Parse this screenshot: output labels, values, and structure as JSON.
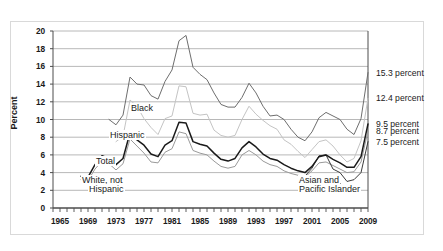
{
  "figure": {
    "ylabel": "Percent"
  },
  "chart_data": {
    "type": "line",
    "title": "",
    "subtitle": "",
    "xlabel": "",
    "ylabel": "Percent",
    "xlim": [
      1964,
      2009
    ],
    "ylim": [
      0,
      20
    ],
    "ytick_step": 2,
    "grid": "horizontal",
    "legend": "inline-annotations",
    "xticks": [
      1965,
      1969,
      1973,
      1977,
      1981,
      1985,
      1989,
      1993,
      1997,
      2001,
      2005,
      2009
    ],
    "xtick_minor_step": 1,
    "yticks": [
      0,
      2,
      4,
      6,
      8,
      10,
      12,
      14,
      16,
      18,
      20
    ],
    "colors": {
      "total": "#1a1a1a",
      "black": "#6e6e6e",
      "hispanic": "#c4c4c4",
      "white_not_hispanic": "#9a9a9a",
      "asian_pacific_islander": "#3c3c3c",
      "gridline": "#a6a6a6",
      "axis": "#4d4d4d",
      "frame": "#d9d9d9"
    },
    "series": [
      {
        "name": "Black",
        "label": "Black",
        "color": "#6e6e6e",
        "x": [
          1972,
          1973,
          1974,
          1975,
          1976,
          1977,
          1978,
          1979,
          1980,
          1981,
          1982,
          1983,
          1984,
          1985,
          1986,
          1987,
          1988,
          1989,
          1990,
          1991,
          1992,
          1993,
          1994,
          1995,
          1996,
          1997,
          1998,
          1999,
          2000,
          2001,
          2002,
          2003,
          2004,
          2005,
          2006,
          2007,
          2008,
          2009
        ],
        "values": [
          10.0,
          9.4,
          10.5,
          14.8,
          14.0,
          13.9,
          12.7,
          12.3,
          14.3,
          15.6,
          18.9,
          19.5,
          15.9,
          15.1,
          14.5,
          13.0,
          11.7,
          11.4,
          11.4,
          12.5,
          14.1,
          13.0,
          11.5,
          10.4,
          10.5,
          10.0,
          8.9,
          8.0,
          7.6,
          8.6,
          10.2,
          10.8,
          10.4,
          10.0,
          8.9,
          8.3,
          10.1,
          15.3
        ]
      },
      {
        "name": "Hispanic",
        "label": "Hispanic",
        "color": "#c4c4c4",
        "x": [
          1973,
          1974,
          1975,
          1976,
          1977,
          1978,
          1979,
          1980,
          1981,
          1982,
          1983,
          1984,
          1985,
          1986,
          1987,
          1988,
          1989,
          1990,
          1991,
          1992,
          1993,
          1994,
          1995,
          1996,
          1997,
          1998,
          1999,
          2000,
          2001,
          2002,
          2003,
          2004,
          2005,
          2006,
          2007,
          2008,
          2009
        ],
        "values": [
          7.5,
          8.1,
          12.2,
          11.5,
          10.1,
          9.1,
          8.3,
          10.1,
          10.4,
          13.8,
          13.7,
          10.7,
          10.5,
          10.6,
          8.8,
          8.2,
          8.0,
          8.2,
          10.0,
          11.5,
          10.6,
          9.9,
          9.3,
          8.9,
          7.7,
          7.2,
          6.4,
          5.7,
          6.6,
          7.5,
          7.7,
          7.0,
          6.0,
          5.2,
          5.6,
          7.6,
          12.4
        ]
      },
      {
        "name": "Total",
        "label": "Total",
        "color": "#1a1a1a",
        "x": [
          1968,
          1969,
          1970,
          1971,
          1972,
          1973,
          1974,
          1975,
          1976,
          1977,
          1978,
          1979,
          1980,
          1981,
          1982,
          1983,
          1984,
          1985,
          1986,
          1987,
          1988,
          1989,
          1990,
          1991,
          1992,
          1993,
          1994,
          1995,
          1996,
          1997,
          1998,
          1999,
          2000,
          2001,
          2002,
          2003,
          2004,
          2005,
          2006,
          2007,
          2008,
          2009
        ],
        "values": [
          3.6,
          3.5,
          4.9,
          5.9,
          5.6,
          4.9,
          5.6,
          8.5,
          7.7,
          7.1,
          6.1,
          5.8,
          7.1,
          7.6,
          9.7,
          9.6,
          7.5,
          7.2,
          7.0,
          6.2,
          5.5,
          5.3,
          5.6,
          6.8,
          7.5,
          6.9,
          6.1,
          5.6,
          5.4,
          4.9,
          4.5,
          4.2,
          4.0,
          4.7,
          5.8,
          6.0,
          5.5,
          5.1,
          4.6,
          4.6,
          5.8,
          9.5
        ]
      },
      {
        "name": "White, not Hispanic",
        "label": "White, not Hispanic",
        "color": "#9a9a9a",
        "x": [
          1968,
          1969,
          1970,
          1971,
          1972,
          1973,
          1974,
          1975,
          1976,
          1977,
          1978,
          1979,
          1980,
          1981,
          1982,
          1983,
          1984,
          1985,
          1986,
          1987,
          1988,
          1989,
          1990,
          1991,
          1992,
          1993,
          1994,
          1995,
          1996,
          1997,
          1998,
          1999,
          2000,
          2001,
          2002,
          2003,
          2004,
          2005,
          2006,
          2007,
          2008,
          2009
        ],
        "values": [
          3.2,
          3.1,
          4.4,
          5.3,
          5.0,
          4.3,
          5.0,
          7.8,
          7.0,
          6.2,
          5.2,
          5.1,
          6.3,
          6.7,
          8.6,
          8.4,
          6.5,
          6.2,
          6.0,
          5.3,
          4.7,
          4.5,
          4.7,
          6.0,
          6.5,
          6.0,
          5.3,
          4.9,
          4.7,
          4.2,
          3.9,
          3.7,
          3.5,
          4.2,
          5.1,
          5.2,
          4.8,
          4.4,
          4.0,
          4.1,
          5.2,
          8.7
        ]
      },
      {
        "name": "Asian and Pacific Islander",
        "label": "Asian and Pacific Islander",
        "color": "#3c3c3c",
        "x": [
          2000,
          2001,
          2002,
          2003,
          2004,
          2005,
          2006,
          2007,
          2008,
          2009
        ],
        "values": [
          3.6,
          4.5,
          5.9,
          6.0,
          4.4,
          4.0,
          3.0,
          3.2,
          4.0,
          7.5
        ]
      }
    ],
    "end_labels": [
      {
        "text": "15.3 percent",
        "value": 15.3,
        "series": "Black"
      },
      {
        "text": "12.4 percent",
        "value": 12.4,
        "series": "Hispanic"
      },
      {
        "text": "9.5 percent",
        "value": 9.5,
        "series": "Total"
      },
      {
        "text": "8.7 percent",
        "value": 8.7,
        "series": "White, not Hispanic"
      },
      {
        "text": "7.5 percent",
        "value": 7.5,
        "series": "Asian and Pacific Islander"
      }
    ],
    "annotations": [
      {
        "text": "Black",
        "x": 1975,
        "y": 11.3
      },
      {
        "text": "Hispanic",
        "x": 1972,
        "y": 8.3
      },
      {
        "text": "Total",
        "x": 1970,
        "y": 5.3
      },
      {
        "text": "White, not",
        "x": 1968,
        "y": 3.2
      },
      {
        "text": "Hispanic",
        "x": 1969,
        "y": 2.1
      },
      {
        "text": "Asian and",
        "x": 1999,
        "y": 3.2
      },
      {
        "text": "Pacific Islander",
        "x": 1999,
        "y": 2.1
      }
    ]
  }
}
